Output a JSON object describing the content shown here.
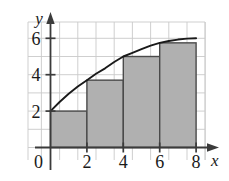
{
  "figure": {
    "background_color": "#ffffff",
    "grid_color": "#c9c9c9",
    "axis_color": "#3b3b3b",
    "bar_fill_color": "#b0b0b0",
    "bar_edge_color": "#4a4a4a",
    "curve_color": "#1a1a1a"
  },
  "labels": {
    "x_axis_name": "x",
    "y_axis_name": "y",
    "origin": "0"
  },
  "chart_data": {
    "type": "bar",
    "title": "",
    "subtitle": "",
    "xlabel": "x",
    "ylabel": "y",
    "xlim": [
      0,
      8
    ],
    "ylim": [
      0,
      6.9
    ],
    "grid": true,
    "grid_step_x": 1,
    "grid_step_y": 1,
    "legend": "none",
    "x_ticks": [
      0,
      2,
      4,
      6,
      8
    ],
    "x_tick_labels": [
      "0",
      "2",
      "4",
      "6",
      "8"
    ],
    "y_ticks": [
      2,
      4,
      6
    ],
    "y_tick_labels": [
      "2",
      "4",
      "6"
    ],
    "categories": [
      "0-2",
      "2-4",
      "4-6",
      "6-8"
    ],
    "bar_intervals": [
      [
        0,
        2
      ],
      [
        2,
        4
      ],
      [
        4,
        6
      ],
      [
        6,
        8
      ]
    ],
    "values": [
      2,
      3.7,
      5,
      5.75
    ],
    "bar_width": 2,
    "rule": "right-endpoint rectangles",
    "series": [
      {
        "name": "curve",
        "type": "line",
        "x": [
          0,
          0.5,
          1,
          1.5,
          2,
          2.5,
          3,
          3.5,
          4,
          4.5,
          5,
          5.5,
          6,
          6.5,
          7,
          7.5,
          8
        ],
        "y": [
          2,
          2.5,
          2.95,
          3.35,
          3.7,
          4.05,
          4.35,
          4.7,
          5,
          5.2,
          5.4,
          5.6,
          5.75,
          5.85,
          5.93,
          5.98,
          6
        ]
      }
    ],
    "annotations": []
  }
}
